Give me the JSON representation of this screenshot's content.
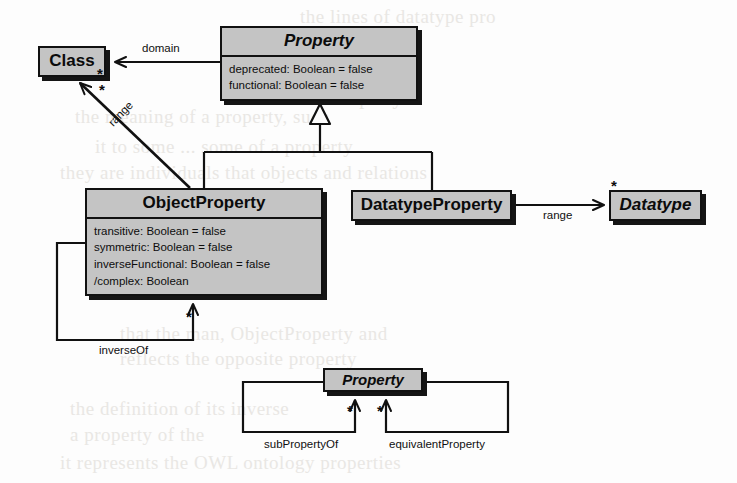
{
  "diagram": {
    "type": "uml-class-diagram",
    "background_color": "#fdfdfd",
    "box_fill_color": "#c4c4c4",
    "line_color": "#111111"
  },
  "classes": [
    {
      "id": "class",
      "name": "Class",
      "abstract": false,
      "attributes": [],
      "x": 38,
      "y": 46,
      "w": 68,
      "h": 31,
      "name_font_size": 17
    },
    {
      "id": "property-top",
      "name": "Property",
      "abstract": true,
      "attributes": [
        "deprecated: Boolean = false",
        "functional: Boolean = false"
      ],
      "x": 220,
      "y": 26,
      "w": 198,
      "h": 78,
      "name_font_size": 17
    },
    {
      "id": "objectproperty",
      "name": "ObjectProperty",
      "abstract": false,
      "attributes": [
        "transitive: Boolean = false",
        "symmetric: Boolean = false",
        "inverseFunctional: Boolean = false",
        "/complex: Boolean"
      ],
      "x": 85,
      "y": 188,
      "w": 238,
      "h": 110,
      "name_font_size": 17
    },
    {
      "id": "datatypeproperty",
      "name": "DatatypeProperty",
      "abstract": false,
      "attributes": [],
      "x": 351,
      "y": 190,
      "w": 161,
      "h": 31,
      "name_font_size": 17
    },
    {
      "id": "datatype",
      "name": "Datatype",
      "abstract": true,
      "attributes": [],
      "x": 609,
      "y": 190,
      "w": 93,
      "h": 31,
      "name_font_size": 17
    },
    {
      "id": "property-bottom",
      "name": "Property",
      "abstract": true,
      "attributes": [],
      "x": 323,
      "y": 368,
      "w": 100,
      "h": 26,
      "name_font_size": 15
    }
  ],
  "associations": [
    {
      "id": "domain",
      "label": "domain",
      "label_x": 142,
      "label_y": 42,
      "from": "property-top",
      "to": "class",
      "multiplicity": "*",
      "mult_x": 97,
      "mult_y": 66
    },
    {
      "id": "range-object",
      "label": "range",
      "label_x": 106,
      "label_y": 120,
      "rotation": -65,
      "from": "objectproperty",
      "to": "class",
      "multiplicity": "*",
      "mult_x": 99,
      "mult_y": 82
    },
    {
      "id": "range-datatype",
      "label": "range",
      "label_x": 543,
      "label_y": 209,
      "from": "datatypeproperty",
      "to": "datatype",
      "multiplicity": "*",
      "mult_x": 611,
      "mult_y": 181
    },
    {
      "id": "inverseof",
      "label": "inverseOf",
      "label_x": 99,
      "label_y": 347,
      "from": "objectproperty",
      "to": "objectproperty",
      "multiplicity": "*",
      "mult_x": 186,
      "mult_y": 310
    },
    {
      "id": "subpropertyof",
      "label": "subPropertyOf",
      "label_x": 264,
      "label_y": 443,
      "from": "property-bottom",
      "to": "property-bottom",
      "multiplicity": "*",
      "mult_x": 348,
      "mult_y": 404
    },
    {
      "id": "equivalentproperty",
      "label": "equivalentProperty",
      "label_x": 389,
      "label_y": 443,
      "from": "property-bottom",
      "to": "property-bottom",
      "multiplicity": "*",
      "mult_x": 378,
      "mult_y": 404
    }
  ],
  "generalizations": [
    {
      "id": "gen-objectproperty",
      "parent": "property-top",
      "child": "objectproperty",
      "notation": "hollow-triangle"
    },
    {
      "id": "gen-datatypeproperty",
      "parent": "property-top",
      "child": "datatypeproperty",
      "notation": "hollow-triangle"
    }
  ],
  "background_text": [
    {
      "text": "the lines of datatype pro",
      "x": 300,
      "y": 6,
      "size": 19
    },
    {
      "text": "Property",
      "x": 330,
      "y": 86,
      "size": 20
    },
    {
      "text": "the meaning of a property, such",
      "x": 75,
      "y": 106,
      "size": 19
    },
    {
      "text": "it to some ... some of a property",
      "x": 95,
      "y": 136,
      "size": 19
    },
    {
      "text": "they are individuals that objects and relations",
      "x": 60,
      "y": 162,
      "size": 19
    },
    {
      "text": "that the man, ObjectProperty and",
      "x": 120,
      "y": 323,
      "size": 19
    },
    {
      "text": "reflects the opposite property",
      "x": 120,
      "y": 348,
      "size": 19
    },
    {
      "text": "the definition of its inverse",
      "x": 70,
      "y": 398,
      "size": 19
    },
    {
      "text": "a property of the",
      "x": 70,
      "y": 424,
      "size": 19
    },
    {
      "text": "it represents the OWL ontology properties",
      "x": 60,
      "y": 452,
      "size": 19
    }
  ]
}
